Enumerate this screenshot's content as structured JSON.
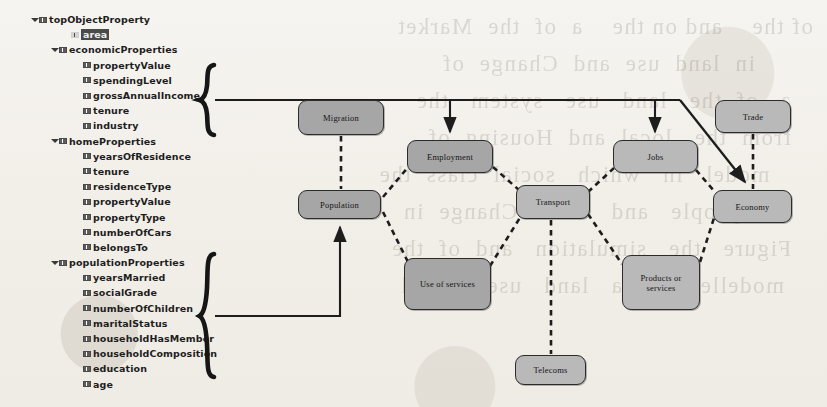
{
  "tree": {
    "name": "object-property-hierarchy",
    "items": [
      {
        "label": "topObjectProperty",
        "level": 0,
        "twisty": "open",
        "selected": false
      },
      {
        "label": "area",
        "level": 2,
        "twisty": "none",
        "selected": true
      },
      {
        "label": "economicProperties",
        "level": 1,
        "twisty": "open",
        "selected": false
      },
      {
        "label": "propertyValue",
        "level": 3,
        "twisty": "none",
        "selected": false
      },
      {
        "label": "spendingLevel",
        "level": 3,
        "twisty": "none",
        "selected": false
      },
      {
        "label": "grossAnnualIncome",
        "level": 3,
        "twisty": "none",
        "selected": false
      },
      {
        "label": "tenure",
        "level": 3,
        "twisty": "none",
        "selected": false
      },
      {
        "label": "industry",
        "level": 3,
        "twisty": "none",
        "selected": false
      },
      {
        "label": "homeProperties",
        "level": 1,
        "twisty": "open",
        "selected": false
      },
      {
        "label": "yearsOfResidence",
        "level": 3,
        "twisty": "none",
        "selected": false
      },
      {
        "label": "tenure",
        "level": 3,
        "twisty": "none",
        "selected": false
      },
      {
        "label": "residenceType",
        "level": 3,
        "twisty": "none",
        "selected": false
      },
      {
        "label": "propertyValue",
        "level": 3,
        "twisty": "none",
        "selected": false
      },
      {
        "label": "propertyType",
        "level": 3,
        "twisty": "none",
        "selected": false
      },
      {
        "label": "numberOfCars",
        "level": 3,
        "twisty": "none",
        "selected": false
      },
      {
        "label": "belongsTo",
        "level": 3,
        "twisty": "none",
        "selected": false
      },
      {
        "label": "populationProperties",
        "level": 1,
        "twisty": "open",
        "selected": false
      },
      {
        "label": "yearsMarried",
        "level": 3,
        "twisty": "none",
        "selected": false
      },
      {
        "label": "socialGrade",
        "level": 3,
        "twisty": "none",
        "selected": false
      },
      {
        "label": "numberOfChildren",
        "level": 3,
        "twisty": "none",
        "selected": false
      },
      {
        "label": "maritalStatus",
        "level": 3,
        "twisty": "none",
        "selected": false
      },
      {
        "label": "householdHasMember",
        "level": 3,
        "twisty": "none",
        "selected": false
      },
      {
        "label": "householdComposition",
        "level": 3,
        "twisty": "none",
        "selected": false
      },
      {
        "label": "education",
        "level": 3,
        "twisty": "none",
        "selected": false
      },
      {
        "label": "age",
        "level": 3,
        "twisty": "none",
        "selected": false
      }
    ]
  },
  "diagram": {
    "nodes": [
      {
        "id": "migration",
        "label": "Migration",
        "x": 298,
        "y": 100,
        "w": 86,
        "h": 35,
        "shade": "dark"
      },
      {
        "id": "population",
        "label": "Population",
        "x": 298,
        "y": 190,
        "w": 83,
        "h": 29,
        "shade": "dark"
      },
      {
        "id": "employment",
        "label": "Employment",
        "x": 407,
        "y": 140,
        "w": 86,
        "h": 33,
        "shade": "dark"
      },
      {
        "id": "use-of-services",
        "label": "Use of services",
        "x": 404,
        "y": 258,
        "w": 87,
        "h": 52,
        "shade": "dark"
      },
      {
        "id": "transport",
        "label": "Transport",
        "x": 516,
        "y": 185,
        "w": 74,
        "h": 34,
        "shade": "light"
      },
      {
        "id": "telecoms",
        "label": "Telecoms",
        "x": 515,
        "y": 355,
        "w": 71,
        "h": 30,
        "shade": "light"
      },
      {
        "id": "jobs",
        "label": "Jobs",
        "x": 613,
        "y": 140,
        "w": 85,
        "h": 33,
        "shade": "light"
      },
      {
        "id": "products-or-services",
        "label": "Products or services",
        "x": 622,
        "y": 255,
        "w": 78,
        "h": 55,
        "shade": "light"
      },
      {
        "id": "trade",
        "label": "Trade",
        "x": 715,
        "y": 100,
        "w": 76,
        "h": 33,
        "shade": "light"
      },
      {
        "id": "economy",
        "label": "Economy",
        "x": 713,
        "y": 190,
        "w": 79,
        "h": 33,
        "shade": "light"
      }
    ],
    "dashed_links": [
      {
        "from": "migration",
        "to": "population"
      },
      {
        "from": "population",
        "to": "employment"
      },
      {
        "from": "population",
        "to": "use-of-services"
      },
      {
        "from": "employment",
        "to": "transport"
      },
      {
        "from": "use-of-services",
        "to": "transport"
      },
      {
        "from": "transport",
        "to": "jobs"
      },
      {
        "from": "transport",
        "to": "products-or-services"
      },
      {
        "from": "transport",
        "to": "telecoms"
      },
      {
        "from": "jobs",
        "to": "economy"
      },
      {
        "from": "products-or-services",
        "to": "economy"
      },
      {
        "from": "trade",
        "to": "economy"
      }
    ],
    "solid_arrows": [
      {
        "from": "economicProperties-brace",
        "to": "employment"
      },
      {
        "from": "economicProperties-brace",
        "to": "jobs"
      },
      {
        "from": "economicProperties-brace",
        "to": "economy"
      },
      {
        "from": "populationProperties-brace",
        "to": "population"
      }
    ],
    "braces": [
      {
        "id": "economic-brace",
        "groups": "economicProperties children",
        "x": 208,
        "top": 64,
        "bottom": 136,
        "tip": 100
      },
      {
        "id": "population-brace",
        "groups": "populationProperties children",
        "x": 208,
        "top": 253,
        "bottom": 378,
        "tip": 316
      }
    ]
  },
  "bleed_text": "of the    and on the    a  of  the  Market\n        in  land  use  and  Change  of\n   a   of  the   land   use   system   the\n   from  the   local  and  Housing  of\n      model   in   which   social  class  the\n    of   people   and   their   Change  in\n   Figure   the   simulation   and  of  the\n    modelled   in   a   land   use   model"
}
